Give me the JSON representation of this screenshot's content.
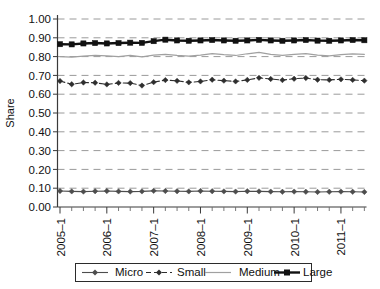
{
  "chart_data": {
    "type": "line",
    "title": "",
    "xlabel": "",
    "ylabel": "Share",
    "ylim": [
      0.0,
      1.0
    ],
    "ytick_labels": [
      "0.00",
      "0.10",
      "0.20",
      "0.30",
      "0.40",
      "0.50",
      "0.60",
      "0.70",
      "0.80",
      "0.90",
      "1.00"
    ],
    "ytick_values": [
      0.0,
      0.1,
      0.2,
      0.3,
      0.4,
      0.5,
      0.6,
      0.7,
      0.8,
      0.9,
      1.0
    ],
    "grid": true,
    "legend_position": "bottom",
    "x_labeled_ticks": [
      "2005–1",
      "2006–1",
      "2007–1",
      "2008–1",
      "2009–1",
      "2010–1",
      "2011–1"
    ],
    "x": [
      "2005-1",
      "2005-2",
      "2005-3",
      "2005-4",
      "2006-1",
      "2006-2",
      "2006-3",
      "2006-4",
      "2007-1",
      "2007-2",
      "2007-3",
      "2007-4",
      "2008-1",
      "2008-2",
      "2008-3",
      "2008-4",
      "2009-1",
      "2009-2",
      "2009-3",
      "2009-4",
      "2010-1",
      "2010-2",
      "2010-3",
      "2010-4",
      "2011-1",
      "2011-2",
      "2011-3"
    ],
    "series": [
      {
        "name": "Micro",
        "color": "#4d4d4d",
        "marker": "diamond",
        "dash": "solid",
        "width": 1.1,
        "values": [
          0.085,
          0.083,
          0.082,
          0.084,
          0.085,
          0.083,
          0.082,
          0.083,
          0.086,
          0.085,
          0.084,
          0.083,
          0.085,
          0.084,
          0.083,
          0.082,
          0.084,
          0.083,
          0.082,
          0.081,
          0.082,
          0.081,
          0.08,
          0.081,
          0.082,
          0.081,
          0.08
        ]
      },
      {
        "name": "Small",
        "color": "#2e2e2e",
        "marker": "diamond",
        "dash": "dashed",
        "width": 1.1,
        "values": [
          0.67,
          0.653,
          0.662,
          0.661,
          0.652,
          0.66,
          0.659,
          0.646,
          0.664,
          0.675,
          0.671,
          0.663,
          0.668,
          0.677,
          0.672,
          0.668,
          0.676,
          0.687,
          0.681,
          0.675,
          0.682,
          0.686,
          0.677,
          0.676,
          0.679,
          0.676,
          0.672
        ]
      },
      {
        "name": "Medium",
        "color": "#a0a0a0",
        "marker": "none",
        "dash": "solid",
        "width": 1.2,
        "values": [
          0.8,
          0.797,
          0.802,
          0.806,
          0.804,
          0.8,
          0.806,
          0.799,
          0.808,
          0.812,
          0.806,
          0.803,
          0.808,
          0.816,
          0.81,
          0.806,
          0.815,
          0.822,
          0.812,
          0.806,
          0.812,
          0.816,
          0.808,
          0.804,
          0.81,
          0.814,
          0.812
        ]
      },
      {
        "name": "Large",
        "color": "#111111",
        "marker": "square",
        "dash": "solid",
        "width": 2.4,
        "values": [
          0.866,
          0.865,
          0.87,
          0.872,
          0.87,
          0.872,
          0.874,
          0.873,
          0.882,
          0.89,
          0.886,
          0.884,
          0.886,
          0.888,
          0.886,
          0.884,
          0.886,
          0.889,
          0.886,
          0.884,
          0.886,
          0.888,
          0.885,
          0.884,
          0.886,
          0.888,
          0.887
        ]
      }
    ]
  },
  "legend": {
    "items": [
      {
        "label": "Micro"
      },
      {
        "label": "Small"
      },
      {
        "label": "Medium"
      },
      {
        "label": "Large"
      }
    ]
  }
}
